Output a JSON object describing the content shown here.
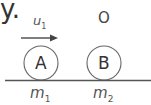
{
  "lead_text": "y.",
  "arrow": {
    "label_base": "u",
    "label_sub": "1"
  },
  "ball_a": {
    "label": "A",
    "mass_base": "m",
    "mass_sub": "1"
  },
  "ball_b": {
    "label": "B",
    "mass_base": "m",
    "mass_sub": "2",
    "velocity_mark": "O"
  },
  "colors": {
    "stroke": "#555555",
    "background": "#ffffff"
  }
}
